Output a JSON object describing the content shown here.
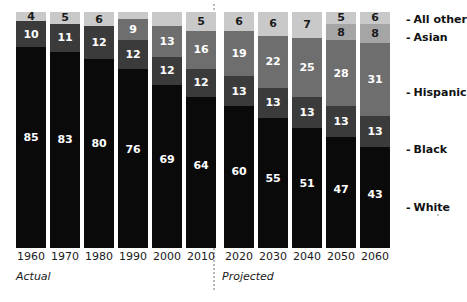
{
  "chart_data": {
    "type": "bar",
    "subtype": "stacked-percentage",
    "title": "",
    "subtitle": "",
    "xlabel": "",
    "ylabel": "",
    "ylim": [
      0,
      100
    ],
    "grid": false,
    "legend_position": "right",
    "categories": [
      "1960",
      "1970",
      "1980",
      "1990",
      "2000",
      "2010",
      "2020",
      "2030",
      "2040",
      "2050",
      "2060"
    ],
    "series": [
      {
        "name": "White",
        "color": "#0a0a0a",
        "values": [
          85,
          83,
          80,
          76,
          69,
          64,
          60,
          55,
          51,
          47,
          43
        ],
        "labels": [
          "85",
          "83",
          "80",
          "76",
          "69",
          "64",
          "60",
          "55",
          "51",
          "47",
          "43"
        ]
      },
      {
        "name": "Black",
        "color": "#3b3b3b",
        "values": [
          10,
          11,
          12,
          12,
          12,
          12,
          13,
          13,
          13,
          13,
          13
        ],
        "labels": [
          "10",
          "11",
          "12",
          "12",
          "12",
          "12",
          "13",
          "13",
          "13",
          "13",
          "13"
        ]
      },
      {
        "name": "Hispanic",
        "color": "#6e6e6e",
        "values": [
          1,
          1,
          2,
          9,
          13,
          16,
          19,
          22,
          25,
          28,
          31
        ],
        "labels": [
          "",
          "",
          "",
          "9",
          "13",
          "16",
          "19",
          "22",
          "25",
          "28",
          "31"
        ]
      },
      {
        "name": "Asian",
        "color": "#a5a5a5",
        "values": [
          1,
          1,
          1,
          1,
          2,
          3,
          6,
          6,
          7,
          8,
          8
        ],
        "labels": [
          "",
          "",
          "",
          "",
          "",
          "",
          "",
          "",
          "",
          "8",
          "8"
        ]
      },
      {
        "name": "All other",
        "color": "#c9c9c9",
        "values": [
          4,
          5,
          6,
          3,
          4,
          5,
          6,
          6,
          7,
          5,
          6
        ],
        "labels": [
          "4",
          "5",
          "6",
          "",
          "",
          "5",
          "6",
          "6",
          "7",
          "5",
          "6"
        ]
      }
    ],
    "annotations": {
      "actual_period": "Actual",
      "projected_period": "Projected",
      "actual_categories": [
        "1960",
        "1970",
        "1980",
        "1990",
        "2000",
        "2010"
      ],
      "projected_categories": [
        "2020",
        "2030",
        "2040",
        "2050",
        "2060"
      ]
    }
  },
  "bars": [
    {
      "category": "1960",
      "segments": [
        {
          "name": "All other",
          "label": "4",
          "pct": 4,
          "style": "seg-other",
          "label_class": "lbl-on-light"
        },
        {
          "name": "Black",
          "label": "10",
          "pct": 11,
          "style": "seg-black",
          "label_class": "lbl-on-dark"
        },
        {
          "name": "White",
          "label": "85",
          "pct": 85,
          "style": "seg-white",
          "label_class": "lbl-on-dark"
        }
      ]
    },
    {
      "category": "1970",
      "segments": [
        {
          "name": "All other",
          "label": "5",
          "pct": 5,
          "style": "seg-other",
          "label_class": "lbl-on-light"
        },
        {
          "name": "Black",
          "label": "11",
          "pct": 12,
          "style": "seg-black",
          "label_class": "lbl-on-dark"
        },
        {
          "name": "White",
          "label": "83",
          "pct": 83,
          "style": "seg-white",
          "label_class": "lbl-on-dark"
        }
      ]
    },
    {
      "category": "1980",
      "segments": [
        {
          "name": "All other",
          "label": "6",
          "pct": 6,
          "style": "seg-other",
          "label_class": "lbl-on-light"
        },
        {
          "name": "Black",
          "label": "12",
          "pct": 14,
          "style": "seg-black",
          "label_class": "lbl-on-dark"
        },
        {
          "name": "White",
          "label": "80",
          "pct": 80,
          "style": "seg-white",
          "label_class": "lbl-on-dark"
        }
      ]
    },
    {
      "category": "1990",
      "segments": [
        {
          "name": "All other",
          "label": "",
          "pct": 3,
          "style": "seg-other",
          "label_class": "lbl-on-light"
        },
        {
          "name": "Hispanic",
          "label": "9",
          "pct": 9,
          "style": "seg-hisp",
          "label_class": "lbl-on-dark"
        },
        {
          "name": "Black",
          "label": "12",
          "pct": 12,
          "style": "seg-black",
          "label_class": "lbl-on-dark"
        },
        {
          "name": "White",
          "label": "76",
          "pct": 76,
          "style": "seg-white",
          "label_class": "lbl-on-dark"
        }
      ]
    },
    {
      "category": "2000",
      "segments": [
        {
          "name": "All other",
          "label": "",
          "pct": 6,
          "style": "seg-other",
          "label_class": "lbl-on-light"
        },
        {
          "name": "Hispanic",
          "label": "13",
          "pct": 13,
          "style": "seg-hisp",
          "label_class": "lbl-on-dark"
        },
        {
          "name": "Black",
          "label": "12",
          "pct": 12,
          "style": "seg-black",
          "label_class": "lbl-on-dark"
        },
        {
          "name": "White",
          "label": "69",
          "pct": 69,
          "style": "seg-white",
          "label_class": "lbl-on-dark"
        }
      ]
    },
    {
      "category": "2010",
      "segments": [
        {
          "name": "All other",
          "label": "5",
          "pct": 8,
          "style": "seg-other",
          "label_class": "lbl-on-light"
        },
        {
          "name": "Hispanic",
          "label": "16",
          "pct": 16,
          "style": "seg-hisp",
          "label_class": "lbl-on-dark"
        },
        {
          "name": "Black",
          "label": "12",
          "pct": 12,
          "style": "seg-black",
          "label_class": "lbl-on-dark"
        },
        {
          "name": "White",
          "label": "64",
          "pct": 64,
          "style": "seg-white",
          "label_class": "lbl-on-dark"
        }
      ]
    },
    {
      "category": "2020",
      "segments": [
        {
          "name": "All other",
          "label": "6",
          "pct": 8,
          "style": "seg-other",
          "label_class": "lbl-on-light"
        },
        {
          "name": "Hispanic",
          "label": "19",
          "pct": 19,
          "style": "seg-hisp",
          "label_class": "lbl-on-dark"
        },
        {
          "name": "Black",
          "label": "13",
          "pct": 13,
          "style": "seg-black",
          "label_class": "lbl-on-dark"
        },
        {
          "name": "White",
          "label": "60",
          "pct": 60,
          "style": "seg-white",
          "label_class": "lbl-on-dark"
        }
      ]
    },
    {
      "category": "2030",
      "segments": [
        {
          "name": "All other",
          "label": "6",
          "pct": 10,
          "style": "seg-other",
          "label_class": "lbl-on-light"
        },
        {
          "name": "Hispanic",
          "label": "22",
          "pct": 22,
          "style": "seg-hisp",
          "label_class": "lbl-on-dark"
        },
        {
          "name": "Black",
          "label": "13",
          "pct": 13,
          "style": "seg-black",
          "label_class": "lbl-on-dark"
        },
        {
          "name": "White",
          "label": "55",
          "pct": 55,
          "style": "seg-white",
          "label_class": "lbl-on-dark"
        }
      ]
    },
    {
      "category": "2040",
      "segments": [
        {
          "name": "All other",
          "label": "7",
          "pct": 11,
          "style": "seg-other",
          "label_class": "lbl-on-light"
        },
        {
          "name": "Hispanic",
          "label": "25",
          "pct": 25,
          "style": "seg-hisp",
          "label_class": "lbl-on-dark"
        },
        {
          "name": "Black",
          "label": "13",
          "pct": 13,
          "style": "seg-black",
          "label_class": "lbl-on-dark"
        },
        {
          "name": "White",
          "label": "51",
          "pct": 51,
          "style": "seg-white",
          "label_class": "lbl-on-dark"
        }
      ]
    },
    {
      "category": "2050",
      "segments": [
        {
          "name": "All other",
          "label": "5",
          "pct": 5,
          "style": "seg-other",
          "label_class": "lbl-on-light"
        },
        {
          "name": "Asian",
          "label": "8",
          "pct": 7,
          "style": "seg-asian",
          "label_class": "lbl-on-light"
        },
        {
          "name": "Hispanic",
          "label": "28",
          "pct": 28,
          "style": "seg-hisp",
          "label_class": "lbl-on-dark"
        },
        {
          "name": "Black",
          "label": "13",
          "pct": 13,
          "style": "seg-black",
          "label_class": "lbl-on-dark"
        },
        {
          "name": "White",
          "label": "47",
          "pct": 47,
          "style": "seg-white",
          "label_class": "lbl-on-dark"
        }
      ]
    },
    {
      "category": "2060",
      "segments": [
        {
          "name": "All other",
          "label": "6",
          "pct": 5,
          "style": "seg-other",
          "label_class": "lbl-on-light"
        },
        {
          "name": "Asian",
          "label": "8",
          "pct": 8,
          "style": "seg-asian",
          "label_class": "lbl-on-light"
        },
        {
          "name": "Hispanic",
          "label": "31",
          "pct": 31,
          "style": "seg-hisp",
          "label_class": "lbl-on-dark"
        },
        {
          "name": "Black",
          "label": "13",
          "pct": 13,
          "style": "seg-black",
          "label_class": "lbl-on-dark"
        },
        {
          "name": "White",
          "label": "43",
          "pct": 43,
          "style": "seg-white",
          "label_class": "lbl-on-dark"
        }
      ]
    }
  ],
  "xaxis": {
    "ticks": [
      "1960",
      "1970",
      "1980",
      "1990",
      "2000",
      "2010",
      "2020",
      "2030",
      "2040",
      "2050",
      "2060"
    ]
  },
  "periods": {
    "actual": "Actual",
    "projected": "Projected"
  },
  "legend": {
    "dash": "-",
    "items": [
      {
        "label": "All other",
        "top": 14
      },
      {
        "label": "Asian",
        "top": 32
      },
      {
        "label": "Hispanic",
        "top": 87
      },
      {
        "label": "Black",
        "top": 144
      },
      {
        "label": "White",
        "top": 202
      }
    ]
  }
}
